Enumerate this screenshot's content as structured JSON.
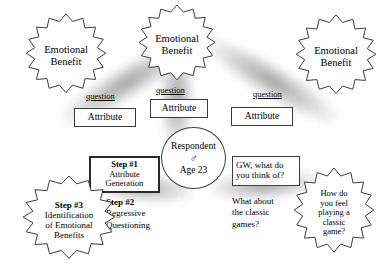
{
  "diagram": {
    "respondent": {
      "label": "Respondent",
      "gender_symbol": "♂",
      "gender_icon": "male-symbol",
      "age": "Age 23"
    },
    "benefits": [
      {
        "id": "left",
        "line1": "Emotional",
        "line2": "Benefit"
      },
      {
        "id": "center",
        "line1": "Emotional",
        "line2": "Benefit"
      },
      {
        "id": "right",
        "line1": "Emotional",
        "line2": "Benefit"
      }
    ],
    "attributes": [
      {
        "id": "left",
        "label": "Attribute"
      },
      {
        "id": "center",
        "label": "Attribute"
      },
      {
        "id": "right",
        "label": "Attribute"
      }
    ],
    "question_links": [
      {
        "id": "left",
        "label": "question"
      },
      {
        "id": "center",
        "label": "question"
      },
      {
        "id": "right",
        "label": "question"
      }
    ],
    "steps": [
      {
        "id": "step1",
        "number": "Step #1",
        "line1": "Attribute",
        "line2": "Generation"
      },
      {
        "id": "step2",
        "number": "Step #2",
        "line1": "Regressive",
        "line2": "Questioning"
      },
      {
        "id": "step3",
        "number": "Step #3",
        "line1": "Identification",
        "line2": "of Emotional",
        "line3": "Benefits"
      }
    ],
    "sample_questions": {
      "prompt_box": {
        "line1": "GW, what do",
        "line2": "you think of?"
      },
      "follow_up": {
        "line1": "What about",
        "line2": "the classic",
        "line3": "games?"
      },
      "emotional_probe": {
        "line1": "How do",
        "line2": "you feel",
        "line3": "playing a",
        "line4": "classic",
        "line5": "game?"
      }
    },
    "colors": {
      "outline": "#3c3c3c",
      "beam": "#787878",
      "background": "#ffffff",
      "text": "#000000"
    }
  }
}
